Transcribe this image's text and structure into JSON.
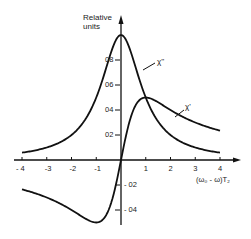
{
  "chart_data": {
    "type": "line",
    "title": "",
    "xlabel": "(ω₀ - ω)T₂",
    "ylabel": "Relative units",
    "xlim": [
      -4,
      4
    ],
    "ylim": [
      -0.5,
      1.0
    ],
    "x_ticks": [
      "- 4",
      "-3",
      "-2",
      "-1",
      "1",
      "2",
      "3",
      "4"
    ],
    "x_tick_values": [
      -4,
      -3,
      -2,
      -1,
      1,
      2,
      3,
      4
    ],
    "y_ticks": [
      "0.8",
      "0.6",
      "0.4",
      "0.2",
      "- 0.2",
      "- 0.4"
    ],
    "y_tick_values": [
      0.8,
      0.6,
      0.4,
      0.2,
      -0.2,
      -0.4
    ],
    "grid": false,
    "legend": "inline labels",
    "x": [
      -4,
      -3.5,
      -3,
      -2.5,
      -2,
      -1.5,
      -1,
      -0.5,
      0,
      0.5,
      1,
      1.5,
      2,
      2.5,
      3,
      3.5,
      4
    ],
    "series": [
      {
        "name": "χ''",
        "label_position": [
          1.4,
          0.78
        ],
        "values": [
          0.059,
          0.075,
          0.1,
          0.138,
          0.2,
          0.308,
          0.5,
          0.8,
          1.0,
          0.8,
          0.5,
          0.308,
          0.2,
          0.138,
          0.1,
          0.075,
          0.059
        ]
      },
      {
        "name": "χ'",
        "label_position": [
          2.6,
          0.4
        ],
        "values": [
          -0.235,
          -0.264,
          -0.3,
          -0.345,
          -0.4,
          -0.462,
          -0.5,
          -0.4,
          0.0,
          0.4,
          0.5,
          0.462,
          0.4,
          0.345,
          0.3,
          0.264,
          0.235
        ]
      }
    ]
  },
  "labels": {
    "ylabel_line1": "Relative",
    "ylabel_line2": "units",
    "xlabel": "(ω₀ - ω)T₂",
    "chi_double_prime": "χ''",
    "chi_prime": "χ'"
  }
}
